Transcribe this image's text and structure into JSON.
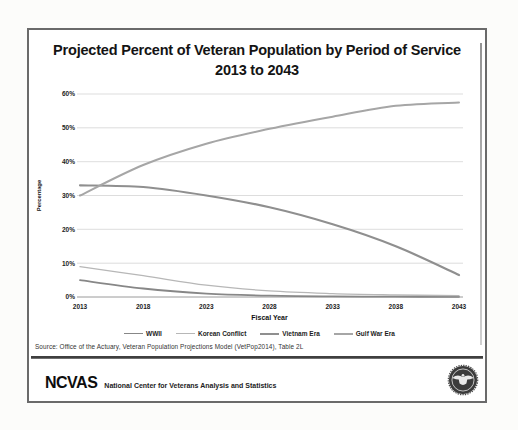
{
  "chart_data": {
    "type": "line",
    "title": "Projected Percent of Veteran Population by Period of Service",
    "subtitle": "2013 to 2043",
    "xlabel": "Fiscal Year",
    "ylabel": "Percentage",
    "x": [
      2013,
      2018,
      2023,
      2028,
      2033,
      2038,
      2043
    ],
    "x_tick_labels": [
      "2013",
      "2018",
      "2023",
      "2028",
      "2033",
      "2038",
      "2043"
    ],
    "y_ticks": [
      0,
      10,
      20,
      30,
      40,
      50,
      60
    ],
    "y_tick_labels": [
      "0%",
      "10%",
      "20%",
      "30%",
      "40%",
      "50%",
      "60%"
    ],
    "ylim": [
      0,
      60
    ],
    "grid": true,
    "legend_position": "bottom",
    "series": [
      {
        "name": "WWII",
        "color": "#878787",
        "width": 1.8,
        "values": [
          5.0,
          2.5,
          1.0,
          0.4,
          0.2,
          0.1,
          0.05
        ]
      },
      {
        "name": "Korean Conflict",
        "color": "#b7b7b7",
        "width": 1.3,
        "values": [
          9.0,
          6.3,
          3.5,
          1.8,
          1.0,
          0.6,
          0.4
        ]
      },
      {
        "name": "Vietnam Era",
        "color": "#8f8f8f",
        "width": 2.2,
        "values": [
          33.0,
          32.5,
          30.0,
          26.5,
          21.5,
          15.0,
          6.5
        ]
      },
      {
        "name": "Gulf War Era",
        "color": "#a6a6a6",
        "width": 2.0,
        "values": [
          30.0,
          39.0,
          45.3,
          49.7,
          53.3,
          56.5,
          57.5
        ]
      }
    ]
  },
  "source_line": "Source:  Office of the Actuary, Veteran Population Projections  Model  (VetPop2014), Table 2L",
  "footer": {
    "logo_text": "NCVAS",
    "org_name": "National Center for Veterans Analysis and Statistics",
    "seal_icon": "va-department-seal"
  },
  "colors": {
    "slide_border": "#6a6a6a",
    "gridline": "#d4d4d4",
    "axis_line": "#9a9a9a",
    "divider": "#3f3f3f",
    "title_text": "#141414",
    "seal_dark": "#3b3b3b"
  }
}
